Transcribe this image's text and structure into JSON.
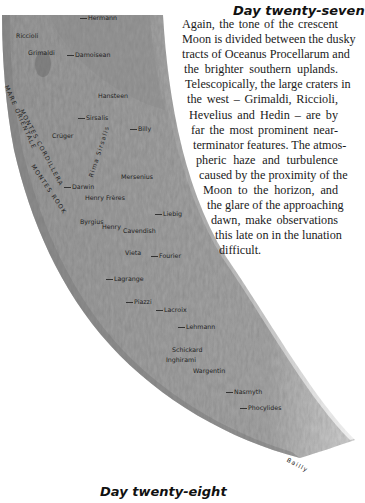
{
  "section_top": {
    "heading": "Day twenty-seven",
    "paragraph_lines": [
      {
        "text": "Again, the tone of the crescent",
        "indent": 0,
        "width": 156
      },
      {
        "text": "Moon is divided between the dusky",
        "indent": 0,
        "width": 156
      },
      {
        "text": "tracts of Oceanus Procellarum and",
        "indent": 0,
        "width": 156
      },
      {
        "text": "the brighter southern uplands.",
        "indent": 2,
        "width": 154
      },
      {
        "text": "Telescopically, the large craters in",
        "indent": 3,
        "width": 153
      },
      {
        "text": "the west – Grimaldi, Riccioli,",
        "indent": 5,
        "width": 151
      },
      {
        "text": "Hevelius and Hedin – are by",
        "indent": 7,
        "width": 149
      },
      {
        "text": "far the most prominent near-",
        "indent": 9,
        "width": 147
      },
      {
        "text": "terminator features. The atmos-",
        "indent": 11,
        "width": 145
      },
      {
        "text": "pheric haze and turbulence",
        "indent": 14,
        "width": 142
      },
      {
        "text": "caused by the proximity of the",
        "indent": 17,
        "width": 139
      },
      {
        "text": "Moon to the horizon, and",
        "indent": 21,
        "width": 135
      },
      {
        "text": "the glare of the approaching",
        "indent": 25,
        "width": 131
      },
      {
        "text": "dawn, make observations",
        "indent": 29,
        "width": 127
      },
      {
        "text": "this late on in the lunation",
        "indent": 33,
        "width": 123
      },
      {
        "text": "difficult.",
        "indent": 37,
        "width": 0
      }
    ]
  },
  "section_bottom": {
    "heading": "Day twenty-eight"
  },
  "map": {
    "colors": {
      "surface": "#9a9a9a",
      "surface_light": "#b9b9b9",
      "mare": "#7f7f7f",
      "background": "#ffffff"
    },
    "labels": [
      {
        "text": "Hermann",
        "x": 80,
        "y": 18,
        "tick": true
      },
      {
        "text": "Riccioli",
        "x": 16,
        "y": 36,
        "tick": false
      },
      {
        "text": "Grimaldi",
        "x": 28,
        "y": 53,
        "tick": false
      },
      {
        "text": "Damoisean",
        "x": 67,
        "y": 55,
        "tick": true
      },
      {
        "text": "Hansteen",
        "x": 98,
        "y": 96,
        "tick": false
      },
      {
        "text": "Sirsalis",
        "x": 78,
        "y": 118,
        "tick": true
      },
      {
        "text": "Billy",
        "x": 130,
        "y": 129,
        "tick": true
      },
      {
        "text": "Crüger",
        "x": 52,
        "y": 136,
        "tick": false
      },
      {
        "text": "Mersenius",
        "x": 121,
        "y": 177,
        "tick": false
      },
      {
        "text": "Darwin",
        "x": 64,
        "y": 187,
        "tick": true
      },
      {
        "text": "Henry Frères",
        "x": 85,
        "y": 198,
        "tick": false
      },
      {
        "text": "Liebig",
        "x": 155,
        "y": 214,
        "tick": true
      },
      {
        "text": "Byrgius",
        "x": 80,
        "y": 222,
        "tick": false
      },
      {
        "text": "Henry",
        "x": 102,
        "y": 227,
        "tick": false
      },
      {
        "text": "Cavendish",
        "x": 123,
        "y": 231,
        "tick": false
      },
      {
        "text": "Vieta",
        "x": 125,
        "y": 253,
        "tick": false
      },
      {
        "text": "Fourier",
        "x": 151,
        "y": 256,
        "tick": true
      },
      {
        "text": "Lagrange",
        "x": 106,
        "y": 279,
        "tick": true
      },
      {
        "text": "Piazzi",
        "x": 126,
        "y": 302,
        "tick": true
      },
      {
        "text": "Lacroix",
        "x": 156,
        "y": 310,
        "tick": true
      },
      {
        "text": "Lehmann",
        "x": 178,
        "y": 327,
        "tick": true
      },
      {
        "text": "Schickard",
        "x": 172,
        "y": 350,
        "tick": false
      },
      {
        "text": "Inghirami",
        "x": 166,
        "y": 360,
        "tick": false
      },
      {
        "text": "Wargentin",
        "x": 193,
        "y": 371,
        "tick": false
      },
      {
        "text": "Nasmyth",
        "x": 226,
        "y": 392,
        "tick": true
      },
      {
        "text": "Phocylides",
        "x": 240,
        "y": 408,
        "tick": true
      }
    ],
    "rotated_labels": [
      {
        "text": "MARE ORIENTALE",
        "x": 10,
        "y": 84,
        "angle": 66
      },
      {
        "text": "MONTES CORDILLERA",
        "x": 25,
        "y": 108,
        "angle": 62
      },
      {
        "text": "MONTES ROOK",
        "x": 36,
        "y": 163,
        "angle": 56
      },
      {
        "text": "Rima Sirsalis",
        "x": 87,
        "y": 176,
        "angle": -72
      },
      {
        "text": "Bailly",
        "x": 289,
        "y": 456,
        "angle": 28
      }
    ]
  }
}
